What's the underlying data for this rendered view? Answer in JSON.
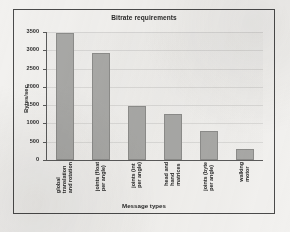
{
  "chart_data": {
    "type": "bar",
    "title": "Bitrate requirements",
    "xlabel": "Message types",
    "ylabel": "Bytes/sec",
    "categories": [
      "global translation and rotation",
      "joints (float per angle)",
      "joints (int per angle)",
      "head and hand matrices",
      "joints (byte per angle)",
      "walking motor"
    ],
    "category_lines": [
      [
        "global",
        "translation",
        "and rotation"
      ],
      [
        "joints (float",
        "per angle)"
      ],
      [
        "joints (int",
        "per angle)"
      ],
      [
        "head and",
        "hand",
        "matrices"
      ],
      [
        "joints (byte",
        "per angle)"
      ],
      [
        "walking",
        "motor"
      ]
    ],
    "values": [
      3480,
      2920,
      1490,
      1250,
      800,
      300
    ],
    "ylim": [
      0,
      3500
    ],
    "yticks": [
      0,
      500,
      1000,
      1500,
      2000,
      2500,
      3000,
      3500
    ],
    "grid": true,
    "legend": "none",
    "bar_color": "#a8a8a6",
    "bar_border_color": "#8c8c8a",
    "frame_color": "#4a4a4a",
    "plot_background": "#eceae8"
  }
}
